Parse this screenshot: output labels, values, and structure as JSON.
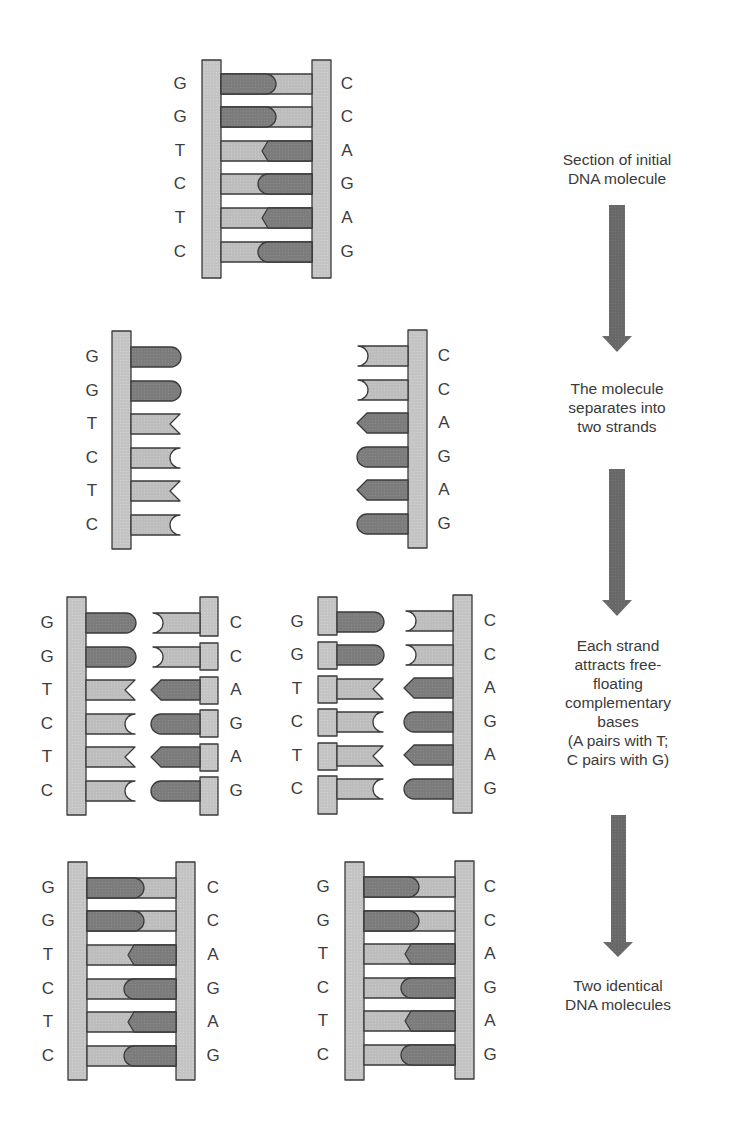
{
  "figure": {
    "colors": {
      "backbone": "#c2c2c2",
      "light_base": "#b9b9b9",
      "dark_base": "#7e7e7e",
      "outline": "#3a3a3a",
      "arrow": "#6a6a6a"
    }
  },
  "steps": [
    {
      "id": "step-1",
      "caption": "Section of initial DNA molecule",
      "caption_lines": [
        "Section of initial",
        "DNA molecule"
      ]
    },
    {
      "id": "step-2",
      "caption": "The molecule separates into two strands",
      "caption_lines": [
        "The molecule",
        "separates into",
        "two strands"
      ]
    },
    {
      "id": "step-3",
      "caption": "Each strand attracts free-floating complementary bases (A pairs with T; C pairs with G)",
      "caption_lines": [
        "Each strand",
        "attracts free-",
        "floating",
        "complementary",
        "bases",
        "(A pairs with T;",
        "C pairs with G)"
      ]
    },
    {
      "id": "step-4",
      "caption": "Two identical DNA molecules",
      "caption_lines": [
        "Two identical",
        "DNA molecules"
      ]
    }
  ],
  "sequence": {
    "left_strand": [
      "G",
      "G",
      "T",
      "C",
      "T",
      "C"
    ],
    "right_strand": [
      "C",
      "C",
      "A",
      "G",
      "A",
      "G"
    ]
  },
  "stages": {
    "initial": {
      "left": [
        "G",
        "G",
        "T",
        "C",
        "T",
        "C"
      ],
      "right": [
        "C",
        "C",
        "A",
        "G",
        "A",
        "G"
      ]
    },
    "separated": {
      "left": [
        "G",
        "G",
        "T",
        "C",
        "T",
        "C"
      ],
      "right": [
        "C",
        "C",
        "A",
        "G",
        "A",
        "G"
      ]
    },
    "attracting_a": {
      "left": [
        "G",
        "G",
        "T",
        "C",
        "T",
        "C"
      ],
      "right": [
        "C",
        "C",
        "A",
        "G",
        "A",
        "G"
      ]
    },
    "attracting_b": {
      "left": [
        "G",
        "G",
        "T",
        "C",
        "T",
        "C"
      ],
      "right": [
        "C",
        "C",
        "A",
        "G",
        "A",
        "G"
      ]
    },
    "final_a": {
      "left": [
        "G",
        "G",
        "T",
        "C",
        "T",
        "C"
      ],
      "right": [
        "C",
        "C",
        "A",
        "G",
        "A",
        "G"
      ]
    },
    "final_b": {
      "left": [
        "G",
        "G",
        "T",
        "C",
        "T",
        "C"
      ],
      "right": [
        "C",
        "C",
        "A",
        "G",
        "A",
        "G"
      ]
    }
  }
}
